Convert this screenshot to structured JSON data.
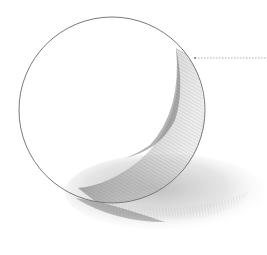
{
  "image": {
    "description": "Pencil sketch of a sphere with core shadow, reflected light and cast shadow",
    "subject": "sphere",
    "background_color": "#ffffff",
    "stroke_color": "#7a7a7a",
    "shadow_dark_color": "#555555",
    "shadow_light_color": "#bdbdbd"
  },
  "sphere": {
    "cx": 112,
    "cy": 110,
    "r": 93
  },
  "cast_shadow": {
    "cx": 160,
    "cy": 195,
    "rx": 100,
    "ry": 42
  },
  "pointer_line": {
    "x1": 195,
    "y1": 58,
    "x2": 267,
    "y2": 58,
    "style": "dotted"
  }
}
